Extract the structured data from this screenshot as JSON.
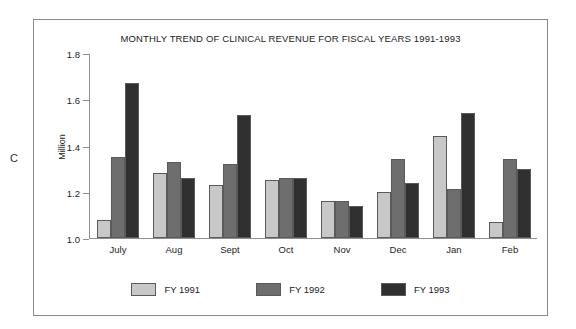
{
  "figure_letter": "C",
  "chart_data": {
    "type": "bar",
    "title": "MONTHLY TREND OF CLINICAL REVENUE FOR FISCAL YEARS 1991-1993",
    "xlabel": "",
    "ylabel": "Million",
    "ylim": [
      1.0,
      1.8
    ],
    "ytick_labels": [
      "1.8",
      "1.6",
      "1.4",
      "1.2",
      "1.0"
    ],
    "yticks": [
      1.8,
      1.6,
      1.4,
      1.2,
      1.0
    ],
    "grid": false,
    "legend_position": "bottom",
    "categories": [
      "July",
      "Aug",
      "Sept",
      "Oct",
      "Nov",
      "Dec",
      "Jan",
      "Feb"
    ],
    "series": [
      {
        "name": "FY 1991",
        "color": "#c8c8c8",
        "values": [
          1.08,
          1.28,
          1.23,
          1.25,
          1.16,
          1.2,
          1.44,
          1.07
        ]
      },
      {
        "name": "FY 1992",
        "color": "#6e6e6e",
        "values": [
          1.35,
          1.33,
          1.32,
          1.26,
          1.16,
          1.34,
          1.21,
          1.34
        ]
      },
      {
        "name": "FY 1993",
        "color": "#303030",
        "values": [
          1.67,
          1.26,
          1.53,
          1.26,
          1.14,
          1.24,
          1.54,
          1.3
        ]
      }
    ]
  }
}
